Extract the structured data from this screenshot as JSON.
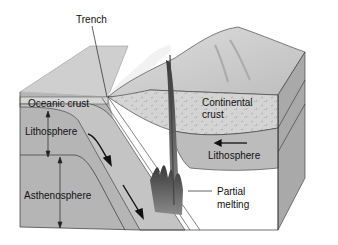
{
  "diagram": {
    "type": "subduction-zone-block-diagram",
    "labels": {
      "trench": "Trench",
      "oceanic_crust": "Oceanic crust",
      "lithosphere_left": "Lithosphere",
      "asthenosphere": "Asthenosphere",
      "continental_crust_line1": "Continental",
      "continental_crust_line2": "crust",
      "lithosphere_right": "Lithosphere",
      "partial_melting_line1": "Partial",
      "partial_melting_line2": "melting"
    },
    "colors": {
      "ocean_surface": "#cfcfcf",
      "block_front": "#b5b5b5",
      "continental_crust": "#d2d2d2",
      "mountain": "#c6c6c6",
      "magma": "#555555",
      "outline": "#222222"
    }
  }
}
